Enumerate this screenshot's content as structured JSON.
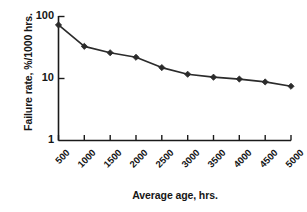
{
  "chart_data": {
    "type": "line",
    "title": "",
    "xlabel": "Average age, hrs.",
    "ylabel": "Failure rate, %/1000 hrs.",
    "x": [
      500,
      1000,
      1500,
      2000,
      2500,
      3000,
      3500,
      4000,
      4500,
      5000
    ],
    "values": [
      73,
      33,
      26,
      22,
      15,
      11.7,
      10.5,
      9.8,
      8.8,
      7.5
    ],
    "series": [
      {
        "name": "Failure rate",
        "values": [
          73,
          33,
          26,
          22,
          15,
          11.7,
          10.5,
          9.8,
          8.8,
          7.5
        ]
      }
    ],
    "xticklabels": [
      "500",
      "1000",
      "1500",
      "2000",
      "2500",
      "3000",
      "3500",
      "4000",
      "4500",
      "5000"
    ],
    "yticklabels": [
      "100",
      "10",
      "1"
    ],
    "ytickvalues": [
      100,
      10,
      1
    ],
    "yscale": "log",
    "xscale": "linear",
    "ylim": [
      1,
      100
    ],
    "xlim": [
      500,
      5000
    ],
    "grid": false,
    "legend": false,
    "marker": "diamond",
    "line_color": "#2b2b2b",
    "marker_color": "#2b2b2b",
    "axis_color": "#1a1a1a",
    "background": "#ffffff"
  }
}
